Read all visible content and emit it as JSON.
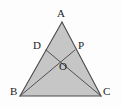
{
  "figure": {
    "kind": "geometry-diagram",
    "shape": "triangle",
    "width": 121,
    "height": 108,
    "background_color": "#fdfdfd",
    "fill_color": "#c6c6c6",
    "stroke_color": "#4a4a4a",
    "label_color": "#1c1c1c",
    "stroke_width": 1.1
  },
  "points": {
    "A": {
      "label": "A",
      "x": 62,
      "y": 22,
      "label_x": 57,
      "label_y": 8
    },
    "B": {
      "label": "B",
      "x": 20,
      "y": 96,
      "label_x": 10,
      "label_y": 86
    },
    "C": {
      "label": "C",
      "x": 101,
      "y": 96,
      "label_x": 103,
      "label_y": 86
    },
    "D": {
      "label": "D",
      "x": 46,
      "y": 50,
      "label_x": 33,
      "label_y": 40
    },
    "P": {
      "label": "P",
      "x": 75,
      "y": 50,
      "label_x": 78,
      "label_y": 40
    },
    "O": {
      "label": "O",
      "x": 63,
      "y": 68,
      "label_x": 59,
      "label_y": 61
    }
  },
  "segments": [
    {
      "name": "side-AB",
      "from": "A",
      "to": "B"
    },
    {
      "name": "side-AC",
      "from": "A",
      "to": "C"
    },
    {
      "name": "side-BC",
      "from": "B",
      "to": "C"
    },
    {
      "name": "cevian-DC",
      "from": "D",
      "to": "C"
    },
    {
      "name": "cevian-BP",
      "from": "B",
      "to": "P"
    }
  ]
}
